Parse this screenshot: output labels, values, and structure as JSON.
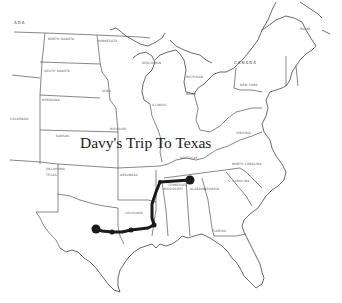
{
  "map": {
    "title": "Davy's Trip To Texas",
    "labels": {
      "usa_fragment": "ADA",
      "canada": "CANADA",
      "north_dakota": "NORTH DAKOTA",
      "south_dakota": "SOUTH DAKOTA",
      "minnesota": "MINNESOTA",
      "nebraska": "NEBRASKA",
      "iowa": "IOWA",
      "kansas": "KANSAS",
      "missouri": "MISSOURI",
      "illinois": "ILLINOIS",
      "oklahoma": "OKLAHOMA",
      "texas": "TEXAS",
      "arkansas": "ARKANSAS",
      "louisiana": "LOUISIANA",
      "tennessee": "TENNESSEE",
      "kentucky": "KENTUCKY",
      "mississippi": "MISSISSIPPI",
      "alabama": "ALABAMA",
      "georgia": "GEORGIA",
      "florida": "FLORIDA",
      "north_carolina": "NORTH CAROLINA",
      "south_carolina": "S. CAROLINA",
      "virginia": "VIRGINIA",
      "new_york": "NEW YORK",
      "michigan": "MICHIGAN",
      "wisconsin": "WISCONSIN",
      "maine": "MAINE",
      "colorado": "COLORADO"
    },
    "route": {
      "color": "#1a1a1a",
      "stops": [
        {
          "name": "start-tennessee",
          "x": 190,
          "y": 180,
          "r": 4.5
        },
        {
          "name": "tennessee-west",
          "x": 160,
          "y": 182,
          "r": 2
        },
        {
          "name": "louisiana-north",
          "x": 154,
          "y": 225,
          "r": 2.5
        },
        {
          "name": "louisiana-border",
          "x": 131,
          "y": 230,
          "r": 2.5
        },
        {
          "name": "texas-east",
          "x": 112,
          "y": 232,
          "r": 2.5
        },
        {
          "name": "end-texas",
          "x": 96,
          "y": 229,
          "r": 4.5
        }
      ]
    }
  }
}
